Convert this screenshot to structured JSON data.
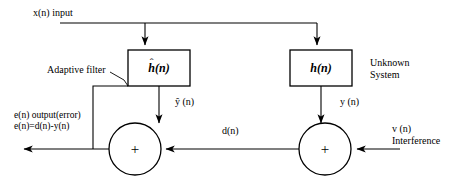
{
  "diagram": {
    "background_color": "#ffffff",
    "line_color": "#000000",
    "labels": {
      "input": "x(n) input",
      "adaptive_filter": "Adaptive filter",
      "unknown_system_line1": "Unknown",
      "unknown_system_line2": "System",
      "filter_output": "ŷ (n)",
      "system_output": "y (n)",
      "desired": "d(n)",
      "error_line1": "e(n) output(error)",
      "error_line2": "e(n)=d(n)-y(n)",
      "interference_line1": "v (n)",
      "interference_line2": "Interference"
    },
    "blocks": [
      {
        "name": "adaptive-filter-block",
        "symbol_base": "h",
        "symbol_arg": "(n)",
        "has_hat": true,
        "hat_glyph": "ˆ",
        "caption": "Adaptive filter"
      },
      {
        "name": "unknown-system-block",
        "symbol_base": "h",
        "symbol_arg": "(n)",
        "has_hat": false,
        "hat_glyph": "",
        "caption": "Unknown System"
      }
    ],
    "summing_junctions": [
      {
        "name": "error-summing-junction",
        "operator": "+"
      },
      {
        "name": "output-summing-junction",
        "operator": "+"
      }
    ],
    "signals": [
      {
        "name": "input-signal",
        "label": "x(n) input"
      },
      {
        "name": "filter-output-signal",
        "label": "ŷ (n)"
      },
      {
        "name": "system-output-signal",
        "label": "y (n)"
      },
      {
        "name": "desired-signal",
        "label": "d(n)"
      },
      {
        "name": "error-signal",
        "label": "e(n) output(error)"
      },
      {
        "name": "interference-signal",
        "label": "v (n)"
      }
    ]
  }
}
